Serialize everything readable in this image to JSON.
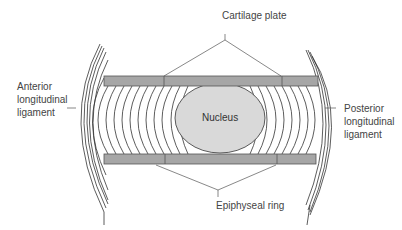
{
  "diagram": {
    "type": "anatomical cross-section",
    "labels": {
      "cartilage_plate": "Cartilage plate",
      "anterior_line1": "Anterior",
      "anterior_line2": "longitudinal",
      "anterior_line3": "ligament",
      "posterior_line1": "Posterior",
      "posterior_line2": "longitudinal",
      "posterior_line3": "ligament",
      "nucleus": "Nucleus",
      "epiphyseal_ring": "Epiphyseal ring"
    },
    "colors": {
      "plate_fill": "#a6a6a6",
      "nucleus_fill": "#d9d9d9",
      "line": "#333333",
      "text": "#444444"
    }
  }
}
